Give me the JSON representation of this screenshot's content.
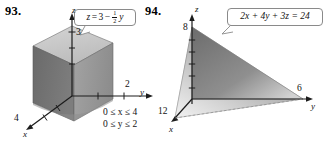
{
  "page": {
    "background_color": "#ffffff",
    "width": 330,
    "height": 146
  },
  "figures": [
    {
      "number": "93.",
      "solid": "rectangular-box",
      "callout_equation": {
        "lhs": "z",
        "relation": "=",
        "rhs_constant": "3",
        "rhs_sign": "−",
        "fraction_numerator": "1",
        "fraction_denominator": "2",
        "rhs_variable": "y",
        "plain_text": "z = 3 - (1/2)y"
      },
      "axes": [
        {
          "name": "z",
          "label": "z",
          "tick_label": "3"
        },
        {
          "name": "y",
          "label": "y",
          "tick_label": "2"
        },
        {
          "name": "x",
          "label": "x",
          "tick_label": "4"
        }
      ],
      "constraints": [
        "0 ≤ x ≤ 4",
        "0 ≤ y ≤ 2"
      ],
      "colors": {
        "face_left": "#6e6e6e",
        "face_right": "#9a9a9a",
        "face_top": "#c8c8c8",
        "axis": "#222222",
        "callout_border": "#8a8a8a"
      }
    },
    {
      "number": "94.",
      "solid": "tetrahedron",
      "callout_equation": {
        "plain_text": "2x + 4y + 3z = 24",
        "terms": [
          "2x",
          "+",
          "4y",
          "+",
          "3z",
          "=",
          "24"
        ]
      },
      "axes": [
        {
          "name": "z",
          "label": "z",
          "tick_label": "8"
        },
        {
          "name": "y",
          "label": "y",
          "tick_label": "6"
        },
        {
          "name": "x",
          "label": "x",
          "tick_label": "12"
        }
      ],
      "colors": {
        "face_left": "#b9b9b9",
        "face_right": "#8d8d8d",
        "axis": "#222222",
        "callout_border": "#8a8a8a"
      }
    }
  ]
}
